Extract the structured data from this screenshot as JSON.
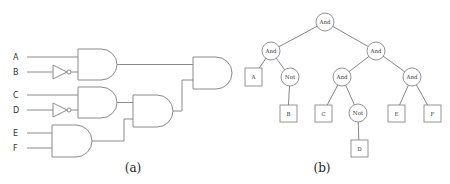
{
  "circuit": {
    "caption": "(a)",
    "inputs": [
      {
        "label": "A",
        "y": 57
      },
      {
        "label": "B",
        "y": 72
      },
      {
        "label": "C",
        "y": 95
      },
      {
        "label": "D",
        "y": 110
      },
      {
        "label": "E",
        "y": 133
      },
      {
        "label": "F",
        "y": 148
      }
    ],
    "gates": [
      {
        "id": "and1",
        "type": "AND",
        "inputs": [
          "A",
          "NOT B"
        ]
      },
      {
        "id": "and2",
        "type": "AND",
        "inputs": [
          "C",
          "NOT D"
        ]
      },
      {
        "id": "and3",
        "type": "AND",
        "inputs": [
          "E",
          "F"
        ]
      },
      {
        "id": "and4",
        "type": "AND",
        "inputs": [
          "and2",
          "and3"
        ]
      },
      {
        "id": "and5",
        "type": "AND",
        "inputs": [
          "and1",
          "and4"
        ]
      }
    ],
    "inverters": [
      "B",
      "D"
    ]
  },
  "tree": {
    "caption": "(b)",
    "nodes": {
      "root": "And",
      "left": "And",
      "right": "And",
      "a": "A",
      "not_b": "Not",
      "b": "B",
      "and_cd": "And",
      "c": "C",
      "not_d": "Not",
      "d": "D",
      "and_ef": "And",
      "e": "E",
      "f": "F"
    }
  }
}
